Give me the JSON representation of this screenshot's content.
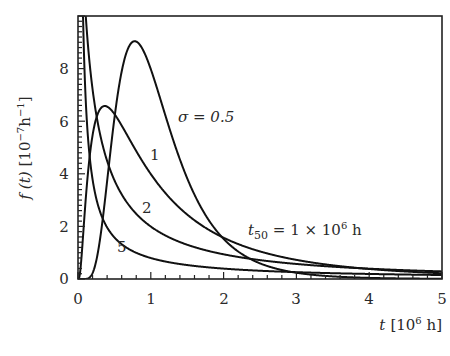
{
  "chart_data": {
    "type": "line",
    "title": "",
    "xlabel": "t [10^6 h]",
    "ylabel": "f(t) [10^-7 h^-1]",
    "xlim": [
      0,
      5
    ],
    "ylim": [
      0,
      10
    ],
    "x_ticks": [
      "0",
      "1",
      "2",
      "3",
      "4",
      "5"
    ],
    "y_ticks": [
      "0",
      "2",
      "4",
      "6",
      "8"
    ],
    "grid": false,
    "legend": null,
    "series": [
      {
        "name": "σ = 0.5",
        "label": "σ = 0.5",
        "sigma": 0.5,
        "x": [
          0.2,
          0.4,
          0.6,
          0.78,
          1.0,
          1.5,
          2.0,
          2.5,
          3.0,
          4.0,
          5.0
        ],
        "y": [
          0.0,
          1.3,
          6.8,
          9.0,
          8.0,
          3.4,
          1.2,
          0.45,
          0.17,
          0.03,
          0.01
        ]
      },
      {
        "name": "σ = 1",
        "label": "1",
        "sigma": 1,
        "x": [
          0.1,
          0.2,
          0.37,
          0.6,
          1.0,
          1.5,
          2.0,
          3.0,
          4.0,
          5.0
        ],
        "y": [
          2.8,
          5.5,
          6.6,
          5.9,
          4.0,
          2.4,
          1.6,
          0.73,
          0.38,
          0.22
        ]
      },
      {
        "name": "σ = 2",
        "label": "2",
        "sigma": 2,
        "x": [
          0.03,
          0.1,
          0.2,
          0.5,
          1.0,
          1.5,
          2.0,
          3.0,
          4.0,
          5.0
        ],
        "y": [
          9.5,
          10.0,
          7.1,
          3.7,
          2.0,
          1.23,
          0.88,
          0.51,
          0.34,
          0.25
        ]
      },
      {
        "name": "σ = 5",
        "label": "5",
        "sigma": 5,
        "x": [
          0.02,
          0.05,
          0.1,
          0.3,
          0.5,
          1.0,
          2.0,
          3.0,
          4.0,
          5.0
        ],
        "y": [
          10.0,
          10.0,
          7.5,
          2.6,
          1.6,
          0.8,
          0.39,
          0.26,
          0.19,
          0.15
        ]
      }
    ],
    "annotations": [
      {
        "text": "σ = 0.5",
        "x": 1.35,
        "y": 7.0
      },
      {
        "text": "1",
        "x": 1.05,
        "y": 4.7
      },
      {
        "text": "2",
        "x": 0.85,
        "y": 2.7
      },
      {
        "text": "5",
        "x": 0.5,
        "y": 1.0
      },
      {
        "text": "t50 = 1 × 10^6 h",
        "x": 2.3,
        "y": 1.7
      }
    ]
  },
  "labels": {
    "xlabel_main": "t",
    "xlabel_unit": "[10",
    "xlabel_exp": "6",
    "xlabel_tail": " h]",
    "ylabel_main": "f (t)",
    "ylabel_unit": "[10",
    "ylabel_exp": "−7",
    "ylabel_h": "h",
    "ylabel_exp2": "−1",
    "ylabel_tail": "]",
    "sigma_anno": "σ = 0.5",
    "label_1": "1",
    "label_2": "2",
    "label_5": "5",
    "t50_t": "t",
    "t50_sub": "50",
    "t50_rest": " = 1 × 10",
    "t50_exp": "6",
    "t50_h": " h"
  },
  "ticks": {
    "x": [
      "0",
      "1",
      "2",
      "3",
      "4",
      "5"
    ],
    "y": [
      "0",
      "2",
      "4",
      "6",
      "8"
    ]
  }
}
